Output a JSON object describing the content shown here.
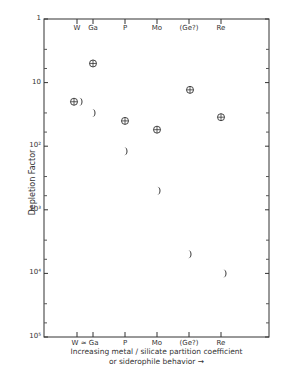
{
  "chart_data": {
    "type": "scatter",
    "title": "",
    "xlabel": "Increasing metal / silicate partition coefficient or siderophile behavior →",
    "xlabel_line1": "Increasing metal / silicate partition coefficient",
    "xlabel_line2": "or siderophile behavior →",
    "ylabel": "Depletion Factor",
    "yscale": "log",
    "ylim": [
      1,
      100000
    ],
    "y_inverted": true,
    "y_ticks": [
      {
        "value": 1,
        "label": "1"
      },
      {
        "value": 10,
        "label": "10"
      },
      {
        "value": 100,
        "label": "10²"
      },
      {
        "value": 1000,
        "label": "10³"
      },
      {
        "value": 10000,
        "label": "10⁴"
      },
      {
        "value": 100000,
        "label": "10⁵"
      }
    ],
    "top_categories": [
      "W",
      "Ga",
      "P",
      "Mo",
      "(Ge?)",
      "Re"
    ],
    "bottom_categories": [
      "W ≈ Ga",
      "P",
      "Mo",
      "(Ge?)",
      "Re"
    ],
    "categories": [
      "W",
      "Ga",
      "P",
      "Mo",
      "(Ge?)",
      "Re"
    ],
    "grid": false,
    "legend": null,
    "series": [
      {
        "name": "Earth (circled cross symbol)",
        "marker": "circle-plus",
        "values": [
          20,
          5,
          40,
          55,
          13,
          35
        ]
      },
      {
        "name": "Moon (crescent symbol)",
        "marker": "crescent",
        "values": [
          20,
          30,
          120,
          500,
          5000,
          10000
        ]
      }
    ]
  }
}
